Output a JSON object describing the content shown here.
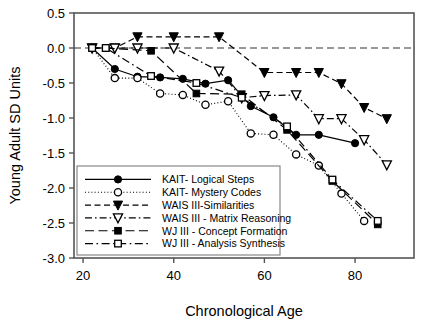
{
  "chart_data": {
    "type": "line",
    "title": "",
    "xlabel": "Chronological Age",
    "ylabel": "Young Adult SD Units",
    "xlim": [
      18,
      93
    ],
    "ylim": [
      -3.0,
      0.5
    ],
    "xticks": [
      20,
      40,
      60,
      80
    ],
    "xtick_labels": [
      "20",
      "40",
      "60",
      "80"
    ],
    "yticks": [
      0.5,
      0.0,
      -0.5,
      -1.0,
      -1.5,
      -2.0,
      -2.5,
      -3.0
    ],
    "ytick_labels": [
      "0.5",
      "0.0",
      "-0.5",
      "-1.0",
      "-1.5",
      "-2.0",
      "-2.5",
      "-3.0"
    ],
    "grid": false,
    "reference_line_y": 0.0,
    "legend_position": "lower-left-inside",
    "series": [
      {
        "name": "KAIT- Logical Steps",
        "marker": "filled-circle",
        "line_style": "solid",
        "x": [
          22,
          27,
          32,
          37,
          42,
          47,
          52,
          57,
          62,
          67,
          72,
          80
        ],
        "y": [
          0.0,
          -0.3,
          -0.41,
          -0.42,
          -0.44,
          -0.51,
          -0.46,
          -0.83,
          -0.99,
          -1.24,
          -1.24,
          -1.36
        ]
      },
      {
        "name": "KAIT- Mystery Codes",
        "marker": "open-circle",
        "line_style": "dotted",
        "x": [
          22,
          27,
          32,
          37,
          42,
          47,
          52,
          57,
          62,
          67,
          72,
          77,
          82
        ],
        "y": [
          0.0,
          -0.43,
          -0.43,
          -0.65,
          -0.67,
          -0.81,
          -0.76,
          -1.22,
          -1.24,
          -1.52,
          -1.68,
          -2.08,
          -2.47
        ]
      },
      {
        "name": "WAIS III-Similarities",
        "marker": "filled-triangle-down",
        "line_style": "dashed",
        "x": [
          22,
          27,
          32,
          40,
          50,
          60,
          67,
          72,
          77,
          82,
          87
        ],
        "y": [
          0.0,
          0.0,
          0.16,
          0.16,
          0.16,
          -0.35,
          -0.35,
          -0.35,
          -0.51,
          -0.85,
          -1.01
        ]
      },
      {
        "name": "WAIS III - Matrix Reasoning",
        "marker": "open-triangle-down",
        "line_style": "dash-dot",
        "x": [
          22,
          27,
          32,
          40,
          50,
          55,
          60,
          67,
          72,
          77,
          82,
          87
        ],
        "y": [
          0.0,
          0.0,
          0.0,
          0.0,
          -0.33,
          -0.71,
          -0.68,
          -0.67,
          -1.01,
          -1.01,
          -1.31,
          -1.67
        ]
      },
      {
        "name": "WJ III - Concept Formation",
        "marker": "filled-square",
        "line_style": "long-dash",
        "x": [
          22,
          25,
          35,
          45,
          55,
          65,
          75,
          85
        ],
        "y": [
          0.0,
          0.0,
          -0.04,
          -0.65,
          -0.66,
          -1.17,
          -1.9,
          -2.52
        ]
      },
      {
        "name": "WJ III - Analysis Synthesis",
        "marker": "open-square",
        "line_style": "dash-dot-long",
        "x": [
          22,
          25,
          35,
          45,
          55,
          65,
          75,
          85
        ],
        "y": [
          0.0,
          0.0,
          -0.4,
          -0.5,
          -0.71,
          -1.12,
          -1.88,
          -2.47
        ]
      }
    ]
  },
  "legend": {
    "items": [
      {
        "label": "KAIT- Logical Steps"
      },
      {
        "label": "KAIT- Mystery Codes"
      },
      {
        "label": "WAIS III-Similarities"
      },
      {
        "label": "WAIS III - Matrix Reasoning"
      },
      {
        "label": "WJ III - Concept Formation"
      },
      {
        "label": "WJ III - Analysis Synthesis"
      }
    ]
  },
  "axes": {
    "x_title": "Chronological Age",
    "y_title": "Young Adult SD Units",
    "x_tick_0": "20",
    "x_tick_1": "40",
    "x_tick_2": "60",
    "x_tick_3": "80",
    "y_tick_0": "0.5",
    "y_tick_1": "0.0",
    "y_tick_2": "-0.5",
    "y_tick_3": "-1.0",
    "y_tick_4": "-1.5",
    "y_tick_5": "-2.0",
    "y_tick_6": "-2.5",
    "y_tick_7": "-3.0"
  },
  "colors": {
    "ink": "#000000",
    "frame": "#555555",
    "background": "#ffffff"
  }
}
